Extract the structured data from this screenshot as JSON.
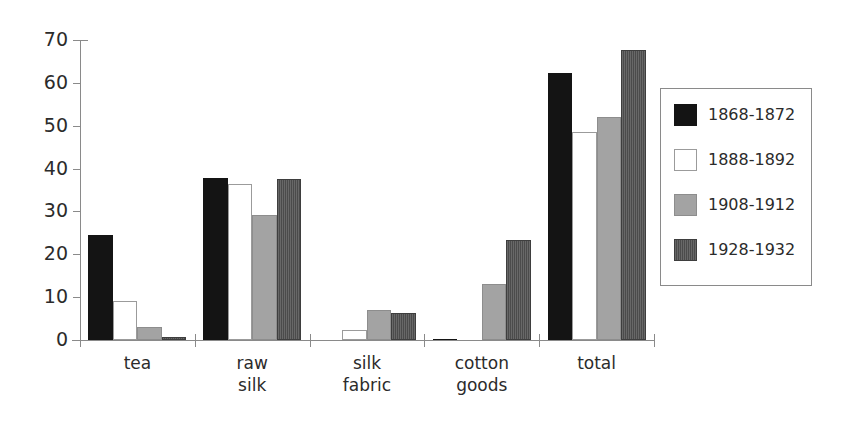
{
  "chart_data": {
    "type": "bar",
    "title": "",
    "subtitle": "",
    "xlabel": "",
    "ylabel": "",
    "ylim": [
      0,
      70
    ],
    "yticks": [
      0,
      10,
      20,
      30,
      40,
      50,
      60,
      70
    ],
    "ytick_labels": [
      "0",
      "10",
      "20",
      "30",
      "40",
      "50",
      "60",
      "70"
    ],
    "grid": false,
    "legend_position": "right",
    "categories": [
      "tea",
      "raw silk",
      "silk fabric",
      "cotton goods",
      "total"
    ],
    "category_lines": [
      [
        "tea"
      ],
      [
        "raw",
        "silk"
      ],
      [
        "silk",
        "fabric"
      ],
      [
        "cotton",
        "goods"
      ],
      [
        "total"
      ]
    ],
    "series": [
      {
        "name": "1868-1872",
        "color": "#141414",
        "style": "solid-black",
        "values": [
          24.5,
          37.8,
          0.0,
          0.3,
          62.3
        ]
      },
      {
        "name": "1888-1892",
        "color": "#ffffff",
        "style": "outlined-white",
        "values": [
          9.0,
          36.5,
          2.3,
          0.0,
          48.5
        ]
      },
      {
        "name": "1908-1912",
        "color": "#a3a3a3",
        "style": "solid-gray",
        "values": [
          3.0,
          29.1,
          7.1,
          13.0,
          52.0
        ]
      },
      {
        "name": "1928-1932",
        "color": "#4b4b4b",
        "style": "hatched-dark-gray",
        "values": [
          0.7,
          37.5,
          6.3,
          23.3,
          67.7
        ]
      }
    ]
  },
  "legend": {
    "entries": [
      {
        "label": "1868-1872"
      },
      {
        "label": "1888-1892"
      },
      {
        "label": "1908-1912"
      },
      {
        "label": "1928-1932"
      }
    ]
  },
  "colors": {
    "axis": "#8a8a8a",
    "text": "#2b2b2b",
    "background": "#ffffff",
    "series_1": "#141414",
    "series_2": "#ffffff",
    "series_3": "#a3a3a3",
    "series_4": "#4b4b4b"
  }
}
